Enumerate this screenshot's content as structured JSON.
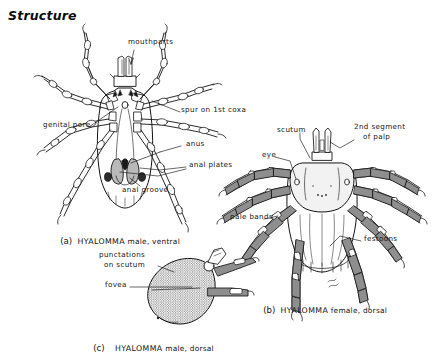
{
  "page": {
    "heading": "Structure",
    "background_color": "#ffffff",
    "ink_color": "#141414",
    "fill_color": "#8a8a8a"
  },
  "figures": [
    {
      "id": "fig-a",
      "caption_letter": "(a)",
      "genus": "HYALOMMA",
      "caption_rest": "male, ventral",
      "labels": [
        {
          "name": "mouthparts",
          "text": "mouthparts",
          "x": 128,
          "y": 41
        },
        {
          "name": "spur-on-1st-coxa",
          "text": "spur on 1st coxa",
          "x": 181,
          "y": 109
        },
        {
          "name": "genital-pore",
          "text": "genital pore",
          "x": 43,
          "y": 124
        },
        {
          "name": "anus",
          "text": "anus",
          "x": 182,
          "y": 143
        },
        {
          "name": "anal-plates",
          "text": "anal plates",
          "x": 187,
          "y": 164
        },
        {
          "name": "anal-groove",
          "text": "anal groove",
          "x": 122,
          "y": 189
        }
      ]
    },
    {
      "id": "fig-b",
      "caption_letter": "(b)",
      "genus": "HYALOMMA",
      "caption_rest": "female, dorsal",
      "labels": [
        {
          "name": "scutum",
          "text": "scutum",
          "x": 277,
          "y": 129
        },
        {
          "name": "2nd-segment-line1",
          "text": "2nd segment",
          "x": 356,
          "y": 126
        },
        {
          "name": "2nd-segment-line2",
          "text": "of palp",
          "x": 363,
          "y": 136
        },
        {
          "name": "eye",
          "text": "eye",
          "x": 264,
          "y": 154
        },
        {
          "name": "pale-bands",
          "text": "pale bands",
          "x": 232,
          "y": 216
        },
        {
          "name": "festoons",
          "text": "festoons",
          "x": 363,
          "y": 238
        }
      ]
    },
    {
      "id": "fig-c",
      "caption_letter": "(c)",
      "genus": "HYALOMMA",
      "caption_rest": "male, dorsal",
      "labels": [
        {
          "name": "punctations-line1",
          "text": "punctations",
          "x": 99,
          "y": 254
        },
        {
          "name": "punctations-line2",
          "text": "on scutum",
          "x": 104,
          "y": 264
        },
        {
          "name": "fovea",
          "text": "fovea",
          "x": 108,
          "y": 284
        }
      ]
    }
  ],
  "captions": [
    {
      "name": "caption-a",
      "letter": "(a)",
      "genus": "HYALOMMA",
      "rest": "male, ventral",
      "x": 55,
      "y": 227
    },
    {
      "name": "caption-b",
      "letter": "(b)",
      "genus": "HYALOMMA",
      "rest": "female, dorsal",
      "x": 258,
      "y": 296
    },
    {
      "name": "caption-c",
      "letter": "(c)",
      "genus": "HYALOMMA",
      "rest": "male, dorsal",
      "x": 88,
      "y": 334
    }
  ]
}
